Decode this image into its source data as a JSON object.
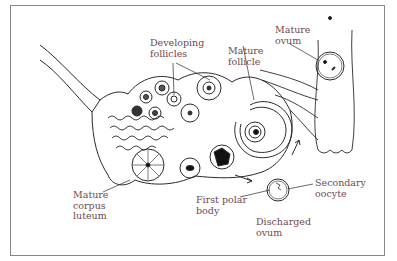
{
  "diagram": {
    "colors": {
      "label": "#6e4a4c",
      "line": "#2a2a2a",
      "frame": "#8a8585"
    },
    "labels": {
      "developing_follicles": "Developing\nfollicles",
      "mature_follicle": "Mature\nfollicle",
      "mature_ovum": "Mature\novum",
      "mature_corpus_luteum": "Mature\ncorpus\nluteum",
      "first_polar_body": "First polar\nbody",
      "discharged_ovum": "Discharged\novum",
      "secondary_oocyte": "Secondary\noocyte"
    }
  }
}
